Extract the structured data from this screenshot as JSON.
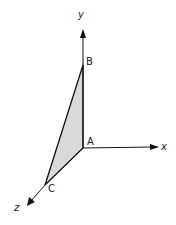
{
  "diagram": {
    "type": "3d-coordinate-triangle",
    "axes": {
      "x_label": "x",
      "y_label": "y",
      "z_label": "z"
    },
    "points": {
      "A": "A",
      "B": "B",
      "C": "C"
    },
    "colors": {
      "line": "#111111",
      "fill": "#d9d9d9",
      "background": "#ffffff"
    }
  }
}
